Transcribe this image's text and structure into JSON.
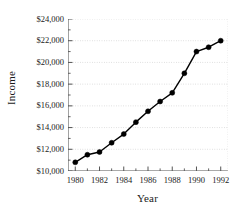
{
  "chart_data": {
    "type": "line",
    "title": "",
    "xlabel": "Year",
    "ylabel": "Income",
    "x": [
      1980,
      1981,
      1982,
      1983,
      1984,
      1985,
      1986,
      1987,
      1988,
      1989,
      1990,
      1991,
      1992
    ],
    "values": [
      10800,
      11500,
      11750,
      12600,
      13400,
      14500,
      15500,
      16400,
      17200,
      19000,
      21000,
      21400,
      22000
    ],
    "xlim": [
      1979.4,
      1992.6
    ],
    "ylim": [
      10000,
      24000
    ],
    "xticks": [
      1980,
      1981,
      1982,
      1983,
      1984,
      1985,
      1986,
      1987,
      1988,
      1989,
      1990,
      1991,
      1992
    ],
    "xtick_labels": [
      "1980",
      "",
      "1982",
      "",
      "1984",
      "",
      "1986",
      "",
      "1988",
      "",
      "1990",
      "",
      "1992"
    ],
    "yticks": [
      10000,
      12000,
      14000,
      16000,
      18000,
      20000,
      22000,
      24000
    ],
    "ytick_labels": [
      "$10,000",
      "$12,000",
      "$14,000",
      "$16,000",
      "$18,000",
      "$20,000",
      "$22,000",
      "$24,000"
    ],
    "y_minor_ticks": [
      11000,
      13000,
      15000,
      17000,
      19000,
      21000,
      23000
    ],
    "grid": true,
    "grid_axis": "y",
    "grid_style": "dotted",
    "legend": null,
    "marker": "filled-circle",
    "series_color": "#000000",
    "grid_color": "#c8c8c8",
    "axis_color": "#555555",
    "background_color": "#ffffff"
  }
}
